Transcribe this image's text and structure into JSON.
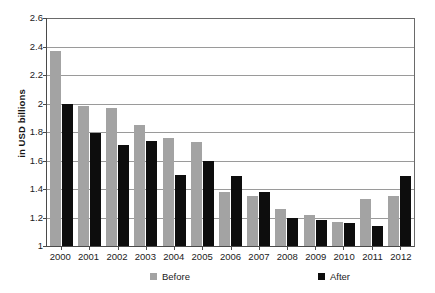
{
  "chart_data": {
    "type": "bar",
    "title": "",
    "subtitle": "",
    "xlabel": "",
    "ylabel": "in USD billions",
    "categories": [
      "2000",
      "2001",
      "2002",
      "2003",
      "2004",
      "2005",
      "2006",
      "2007",
      "2008",
      "2009",
      "2010",
      "2011",
      "2012"
    ],
    "series": [
      {
        "name": "Before",
        "color": "#a3a3a3",
        "values": [
          2.37,
          1.98,
          1.97,
          1.85,
          1.76,
          1.73,
          1.38,
          1.35,
          1.26,
          1.22,
          1.17,
          1.33,
          1.35
        ]
      },
      {
        "name": "After",
        "color": "#0d0d0d",
        "values": [
          2.0,
          1.79,
          1.71,
          1.74,
          1.5,
          1.6,
          1.49,
          1.38,
          1.2,
          1.18,
          1.16,
          1.14,
          1.49
        ]
      }
    ],
    "ylim": [
      1,
      2.6
    ],
    "ytick_labels": [
      "2.6",
      "2.4",
      "2.2",
      "2",
      "1.8",
      "1.6",
      "1.4",
      "1.2",
      "1"
    ],
    "ytick_values": [
      2.6,
      2.4,
      2.2,
      2.0,
      1.8,
      1.6,
      1.4,
      1.2,
      1.0
    ],
    "grid": true,
    "legend_position": "bottom",
    "legend": [
      {
        "label": "Before",
        "color": "#a3a3a3"
      },
      {
        "label": "After",
        "color": "#0d0d0d"
      }
    ]
  }
}
